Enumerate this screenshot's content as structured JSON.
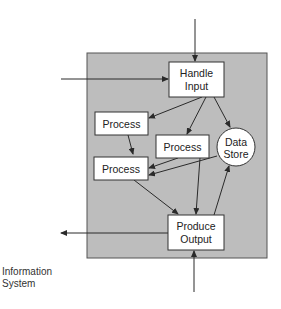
{
  "diagram": {
    "system_label": [
      "Information",
      "System"
    ],
    "nodes": {
      "handle_input": [
        "Handle",
        "Input"
      ],
      "process_1": "Process",
      "process_2": "Process",
      "process_3": "Process",
      "data_store": [
        "Data",
        "Store"
      ],
      "produce_output": [
        "Produce",
        "Output"
      ]
    },
    "colors": {
      "system_fill": "#bdbdbd",
      "system_border": "#555555",
      "node_fill": "#ffffff",
      "line": "#2a2a2a"
    }
  }
}
